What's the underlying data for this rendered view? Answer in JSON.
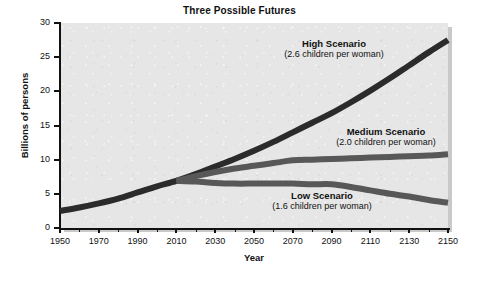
{
  "chart_data": {
    "type": "line",
    "title": "Three Possible Futures",
    "xlabel": "Year",
    "ylabel": "Billions of persons",
    "xlim": [
      1950,
      2150
    ],
    "ylim": [
      0,
      30
    ],
    "xticks": [
      1950,
      1970,
      1990,
      2010,
      2030,
      2050,
      2070,
      2090,
      2110,
      2130,
      2150
    ],
    "xtick_labels": [
      "1950",
      "1970",
      "1990",
      "2010",
      "2030",
      "2050",
      "2070",
      "2090",
      "2110",
      "2130",
      "2150"
    ],
    "xtick_minor_step": 10,
    "yticks": [
      0,
      5,
      10,
      15,
      20,
      25,
      30
    ],
    "ytick_labels": [
      "0",
      "5",
      "10",
      "15",
      "20",
      "25",
      "30"
    ],
    "grid": false,
    "legend_position": "inline-annotations",
    "plot_background": "#e6e6e6",
    "series": [
      {
        "name": "High Scenario",
        "color": "#2b2b2b",
        "line_width": 6,
        "x": [
          1950,
          1960,
          1970,
          1980,
          1990,
          2000,
          2010,
          2020,
          2030,
          2040,
          2050,
          2060,
          2070,
          2080,
          2090,
          2100,
          2110,
          2120,
          2130,
          2140,
          2150
        ],
        "values": [
          2.5,
          3.0,
          3.6,
          4.3,
          5.2,
          6.1,
          6.9,
          7.9,
          9.0,
          10.1,
          11.3,
          12.6,
          14.0,
          15.4,
          16.8,
          18.4,
          20.1,
          21.9,
          23.8,
          25.7,
          27.5
        ]
      },
      {
        "name": "Medium Scenario",
        "color": "#585858",
        "line_width": 6,
        "x": [
          2010,
          2020,
          2030,
          2040,
          2050,
          2060,
          2070,
          2080,
          2090,
          2100,
          2110,
          2120,
          2130,
          2140,
          2150
        ],
        "values": [
          6.9,
          7.6,
          8.2,
          8.7,
          9.1,
          9.5,
          9.9,
          10.0,
          10.1,
          10.2,
          10.3,
          10.4,
          10.5,
          10.6,
          10.8
        ]
      },
      {
        "name": "Low Scenario",
        "color": "#585858",
        "line_width": 6,
        "x": [
          2010,
          2020,
          2030,
          2040,
          2050,
          2060,
          2070,
          2080,
          2090,
          2100,
          2110,
          2120,
          2130,
          2140,
          2150
        ],
        "values": [
          6.9,
          6.8,
          6.6,
          6.5,
          6.5,
          6.5,
          6.5,
          6.4,
          6.4,
          6.0,
          5.5,
          5.0,
          4.6,
          4.1,
          3.7
        ]
      }
    ],
    "annotations": [
      {
        "id": "high",
        "title": "High Scenario",
        "subtitle": "(2.6 children per woman)"
      },
      {
        "id": "medium",
        "title": "Medium Scenario",
        "subtitle": "(2.0 children per woman)"
      },
      {
        "id": "low",
        "title": "Low Scenario",
        "subtitle": "(1.6 children per woman)"
      }
    ]
  }
}
